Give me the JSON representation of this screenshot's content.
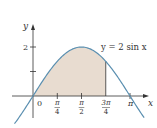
{
  "chart_data": {
    "type": "area",
    "title": "",
    "function_label": "y = 2 sin x",
    "xlabel": "x",
    "ylabel": "y",
    "x_ticks": [
      {
        "value": 0,
        "label": "0"
      },
      {
        "value": 0.7854,
        "label_num": "π",
        "label_den": "4"
      },
      {
        "value": 1.5708,
        "label_num": "π",
        "label_den": "2"
      },
      {
        "value": 2.3562,
        "label_num": "3π",
        "label_den": "4"
      },
      {
        "value": 3.1416,
        "label": "π"
      }
    ],
    "y_ticks": [
      {
        "value": 1,
        "label": ""
      },
      {
        "value": 2,
        "label": "2"
      }
    ],
    "xlim": [
      -0.6,
      3.6
    ],
    "ylim": [
      -1.2,
      2.8
    ],
    "curve": {
      "expression": "2*sin(x)",
      "domain": [
        -0.6,
        3.6
      ],
      "x": [
        -0.6,
        0,
        0.3927,
        0.7854,
        1.1781,
        1.5708,
        1.9635,
        2.3562,
        2.7489,
        3.1416,
        3.6
      ],
      "y": [
        -1.13,
        0,
        0.765,
        1.414,
        1.848,
        2.0,
        1.848,
        1.414,
        0.765,
        0,
        -0.885
      ]
    },
    "shaded_region": {
      "from": 0,
      "to": 2.3562,
      "description": "area under y = 2 sin x from 0 to 3π/4"
    },
    "colors": {
      "curve": "#5a8fb0",
      "shade": "#e8dcd0",
      "axis": "#333333"
    }
  }
}
